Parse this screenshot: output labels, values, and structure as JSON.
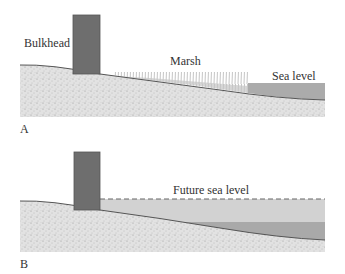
{
  "panels": [
    {
      "id": "A",
      "letter": "A",
      "labels": {
        "bulkhead": "Bulkhead",
        "marsh": "Marsh",
        "sea_level": "Sea level"
      }
    },
    {
      "id": "B",
      "letter": "B",
      "labels": {
        "future_sea_level": "Future sea level"
      }
    }
  ],
  "colors": {
    "sediment": "#dcdcdc",
    "bulkhead": "#6e6e6e",
    "water_current": "#a9a9a9",
    "water_future": "#cfcfcf",
    "marsh": "#bdbdbd",
    "outline": "#555555"
  }
}
